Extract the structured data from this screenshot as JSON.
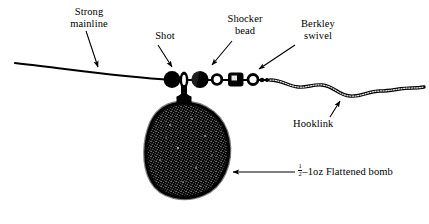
{
  "diagram": {
    "background_color": "#ffffff",
    "ink_color": "#000000",
    "labels": {
      "strong_mainline": "Strong\nmainline",
      "strong_mainline_line1": "Strong",
      "strong_mainline_line2": "mainline",
      "shot": "Shot",
      "shocker_bead_line1": "Shocker",
      "shocker_bead_line2": "bead",
      "berkley_swivel_line1": "Berkley",
      "berkley_swivel_line2": "swivel",
      "hooklink": "Hooklink",
      "bomb_fraction_numerator": "1",
      "bomb_fraction_denominator": "2",
      "bomb_text": "–1oz Flattened bomb",
      "bomb_full": "½–1oz Flattened bomb"
    },
    "components": [
      {
        "name": "mainline",
        "description": "monofilament line running from upper left, gently sloping down to the right"
      },
      {
        "name": "shot",
        "description": "split shot stopper, solid black circle"
      },
      {
        "name": "lead-loop",
        "description": "vertical oval loop holding the lead swivel"
      },
      {
        "name": "shocker-bead",
        "description": "solid black round bead"
      },
      {
        "name": "white-ring-1",
        "description": "small open ring / bead"
      },
      {
        "name": "berkley-swivel",
        "description": "rounded square barrel swivel body"
      },
      {
        "name": "white-ring-2",
        "description": "small open ring / swivel eye"
      },
      {
        "name": "hooklink",
        "description": "braided hooklink, wavy beaded texture running to the right edge"
      },
      {
        "name": "flattened-bomb",
        "description": "large textured pear / flattened bomb lead weight suspended below the rig"
      }
    ]
  }
}
